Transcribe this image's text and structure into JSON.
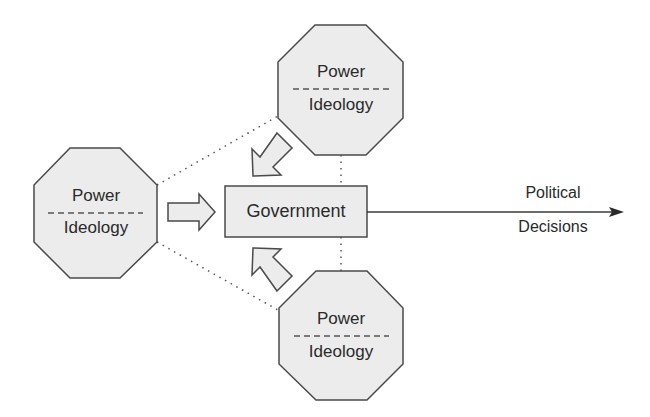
{
  "diagram": {
    "nodes": [
      {
        "id": "left",
        "top_label": "Power",
        "bottom_label": "Ideology"
      },
      {
        "id": "top",
        "top_label": "Power",
        "bottom_label": "Ideology"
      },
      {
        "id": "bottom",
        "top_label": "Power",
        "bottom_label": "Ideology"
      }
    ],
    "center": {
      "label": "Government"
    },
    "output": {
      "line1": "Political",
      "line2": "Decisions"
    },
    "colors": {
      "fill": "#ececec",
      "stroke": "#4a4a4a",
      "text": "#2a2a2a"
    }
  }
}
